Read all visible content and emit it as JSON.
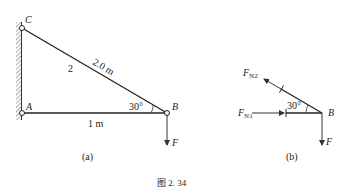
{
  "figure": {
    "caption": "图 2. 34",
    "subfig_a": {
      "label": "(a)",
      "points": {
        "A": "A",
        "B": "B",
        "C": "C"
      },
      "member_label": "2",
      "length_BC": "2.0 m",
      "length_AB": "1 m",
      "angle": "30°",
      "force": "F"
    },
    "subfig_b": {
      "label": "(b)",
      "point": "B",
      "angle": "30°",
      "force": "F",
      "fn1": {
        "main": "F",
        "sub": "N1"
      },
      "fn2": {
        "main": "F",
        "sub": "N2"
      }
    }
  }
}
